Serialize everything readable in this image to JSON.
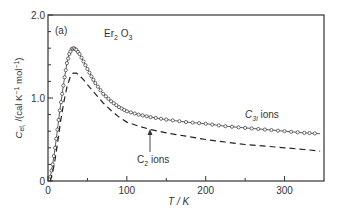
{
  "chart_data": {
    "type": "line",
    "title": "",
    "panel_label": "(a)",
    "compound_label": "Er2O3",
    "xlabel": "T / K",
    "ylabel": "Cel, /(cal K⁻¹ mol⁻¹)",
    "xlim": [
      0,
      350
    ],
    "ylim": [
      0,
      2.0
    ],
    "x_ticks": [
      0,
      100,
      200,
      300
    ],
    "x_minor_ticks": [
      50,
      150,
      250
    ],
    "y_ticks": [
      0,
      1.0,
      2.0
    ],
    "y_tick_labels": [
      "0",
      "1.0",
      "2.0"
    ],
    "y_minor_ticks": [
      0.2,
      0.4,
      0.6,
      0.8,
      1.2,
      1.4,
      1.6,
      1.8
    ],
    "grid": false,
    "series": [
      {
        "name": "C3i ions",
        "style": "solid line with open circles",
        "x": [
          3,
          6,
          9,
          12,
          15,
          18,
          21,
          24,
          27,
          30,
          33,
          36,
          40,
          45,
          50,
          55,
          60,
          70,
          80,
          90,
          100,
          115,
          130,
          150,
          175,
          200,
          225,
          250,
          275,
          300,
          325,
          345
        ],
        "y": [
          0.05,
          0.2,
          0.4,
          0.62,
          0.85,
          1.05,
          1.25,
          1.42,
          1.53,
          1.59,
          1.6,
          1.58,
          1.53,
          1.44,
          1.35,
          1.26,
          1.18,
          1.05,
          0.96,
          0.89,
          0.84,
          0.8,
          0.77,
          0.74,
          0.71,
          0.69,
          0.66,
          0.64,
          0.62,
          0.6,
          0.58,
          0.57
        ]
      },
      {
        "name": "C2 ions",
        "style": "dashed line",
        "x": [
          3,
          8,
          12,
          16,
          20,
          24,
          28,
          32,
          36,
          40,
          45,
          50,
          60,
          70,
          80,
          90,
          100,
          115,
          130,
          150,
          175,
          200,
          225,
          250,
          275,
          300,
          325,
          345
        ],
        "y": [
          0.0,
          0.2,
          0.45,
          0.72,
          0.95,
          1.13,
          1.25,
          1.3,
          1.3,
          1.27,
          1.22,
          1.16,
          1.05,
          0.94,
          0.85,
          0.77,
          0.71,
          0.66,
          0.62,
          0.58,
          0.54,
          0.5,
          0.47,
          0.44,
          0.42,
          0.4,
          0.38,
          0.36
        ]
      }
    ],
    "annotations": [
      {
        "text": "C3i ions",
        "x": 245,
        "y": 0.8
      },
      {
        "text": "C2 ions",
        "x": 128,
        "y": 0.28,
        "arrow_to": {
          "x": 128,
          "y": 0.62
        }
      }
    ]
  }
}
